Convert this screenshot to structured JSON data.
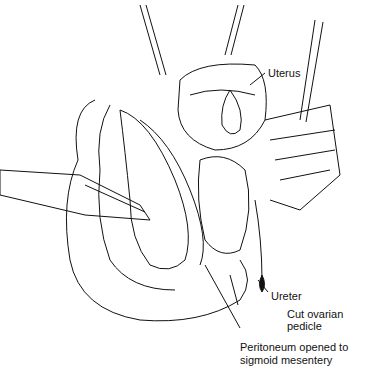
{
  "figure": {
    "type": "surgical illustration",
    "labels": {
      "uterus": "Uterus",
      "ureter": "Ureter",
      "ovarian_pedicle_line1": "Cut ovarian",
      "ovarian_pedicle_line2": "pedicle",
      "peritoneum_line1": "Peritoneum opened to",
      "peritoneum_line2": "sigmoid mesentery"
    }
  }
}
